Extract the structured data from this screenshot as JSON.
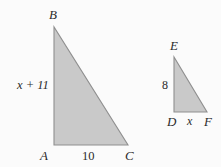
{
  "figure": {
    "background_color": "#fbfbfb",
    "fill_color": "#c9c9c9",
    "stroke_color": "#8a8a8a",
    "text_color": "#2b2b2b"
  },
  "triangle_large": {
    "name": "triangle-abc",
    "vertices": {
      "B": {
        "label": "B",
        "x": 54,
        "y": 27
      },
      "A": {
        "label": "A",
        "x": 54,
        "y": 145
      },
      "C": {
        "label": "C",
        "x": 128,
        "y": 145
      }
    },
    "vertex_labels": {
      "B": "B",
      "A": "A",
      "C": "C"
    },
    "side_labels": {
      "leg_vertical": "x + 11",
      "leg_horizontal": "10"
    }
  },
  "triangle_small": {
    "name": "triangle-def",
    "vertices": {
      "E": {
        "label": "E",
        "x": 174,
        "y": 57
      },
      "D": {
        "label": "D",
        "x": 174,
        "y": 112
      },
      "F": {
        "label": "F",
        "x": 207,
        "y": 112
      }
    },
    "vertex_labels": {
      "E": "E",
      "D": "D",
      "F": "F"
    },
    "side_labels": {
      "leg_vertical": "8",
      "leg_horizontal": "x"
    }
  }
}
